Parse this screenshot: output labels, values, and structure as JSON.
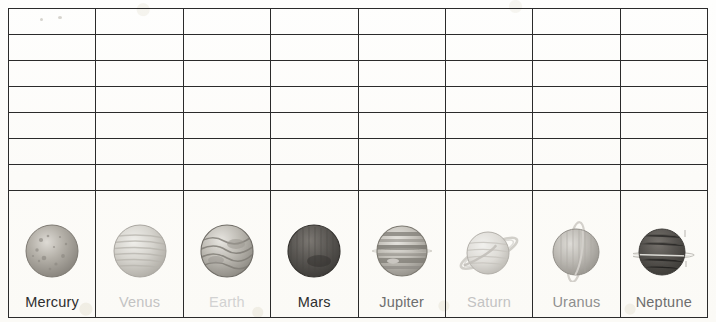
{
  "document": {
    "type": "worksheet-table",
    "description": "Scanned blank worksheet grid with a bottom row of solar system planet illustrations and labels",
    "columns": 8,
    "blank_rows": 7,
    "background_color": "#fdfdfc",
    "grid_line_color": "#2b2b2b"
  },
  "planets": [
    {
      "label": "Mercury",
      "icon": "planet-mercury-icon",
      "label_color": "#2e2e2e",
      "label_tone": "dark",
      "body_color": "#a6a29b",
      "rings": "none",
      "surface": "cratered"
    },
    {
      "label": "Venus",
      "icon": "planet-venus-icon",
      "label_color": "#c3c3c3",
      "label_tone": "light",
      "body_color": "#cfcdc7",
      "rings": "none",
      "surface": "banded-faint"
    },
    {
      "label": "Earth",
      "icon": "planet-earth-icon",
      "label_color": "#d2d2d2",
      "label_tone": "light",
      "body_color": "#b4b0a9",
      "rings": "none",
      "surface": "swirled"
    },
    {
      "label": "Mars",
      "icon": "planet-mars-icon",
      "label_color": "#2e2e2e",
      "label_tone": "dark",
      "body_color": "#5e5b57",
      "rings": "none",
      "surface": "solid-dark"
    },
    {
      "label": "Jupiter",
      "icon": "planet-jupiter-icon",
      "label_color": "#6e6e6e",
      "label_tone": "mid",
      "body_color": "#b9b5ae",
      "rings": "none",
      "surface": "banded-strong"
    },
    {
      "label": "Saturn",
      "icon": "planet-saturn-icon",
      "label_color": "#c3c3c3",
      "label_tone": "light",
      "body_color": "#dbd9d4",
      "rings": "tilted",
      "surface": "banded-faint"
    },
    {
      "label": "Uranus",
      "icon": "planet-uranus-icon",
      "label_color": "#8e8e8e",
      "label_tone": "mid-light",
      "body_color": "#b2b0ab",
      "rings": "vertical",
      "surface": "banded-vertical"
    },
    {
      "label": "Neptune",
      "icon": "planet-neptune-icon",
      "label_color": "#6e6e6e",
      "label_tone": "mid",
      "body_color": "#575450",
      "rings": "horizontal-thin",
      "surface": "solid-dark"
    }
  ]
}
